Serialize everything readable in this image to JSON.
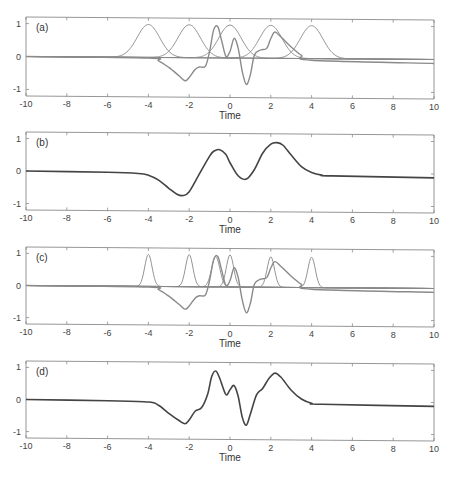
{
  "chart_data": [
    {
      "panel": "(a)",
      "type": "line",
      "title": "",
      "xlabel": "Time",
      "ylabel": "",
      "xlim": [
        -10,
        10
      ],
      "ylim": [
        -1.2,
        1.2
      ],
      "xticks": [
        -10,
        -8,
        -6,
        -4,
        -2,
        0,
        2,
        4,
        6,
        8,
        10
      ],
      "yticks": [
        -1,
        0,
        1
      ],
      "grid": false,
      "legend": null,
      "series": [
        {
          "name": "gaussian basis centered -4",
          "kind": "basis",
          "center": -4,
          "width": 0.55,
          "amplitude": 1
        },
        {
          "name": "gaussian basis centered -2",
          "kind": "basis",
          "center": -2,
          "width": 0.55,
          "amplitude": 1
        },
        {
          "name": "gaussian basis centered 0",
          "kind": "basis",
          "center": 0,
          "width": 0.55,
          "amplitude": 1
        },
        {
          "name": "gaussian basis centered 2",
          "kind": "basis",
          "center": 2,
          "width": 0.55,
          "amplitude": 1
        },
        {
          "name": "gaussian basis centered 4",
          "kind": "basis",
          "center": 4,
          "width": 0.55,
          "amplitude": 1
        },
        {
          "name": "target signal",
          "kind": "signal",
          "x": [
            -10,
            -4,
            -3.5,
            -3,
            -2.5,
            -2.2,
            -2,
            -1.7,
            -1.5,
            -1.2,
            -1,
            -0.8,
            -0.6,
            -0.4,
            -0.2,
            0,
            0.2,
            0.4,
            0.6,
            0.8,
            1.0,
            1.2,
            1.5,
            1.8,
            2.0,
            2.2,
            2.5,
            3.0,
            3.5,
            4.0,
            10
          ],
          "y": [
            0,
            -0.02,
            -0.1,
            -0.3,
            -0.55,
            -0.7,
            -0.6,
            -0.35,
            -0.28,
            -0.25,
            0.2,
            0.85,
            0.95,
            0.5,
            0.05,
            0.2,
            0.6,
            0.3,
            -0.4,
            -0.8,
            -0.5,
            0.1,
            0.25,
            0.3,
            0.6,
            0.8,
            0.65,
            0.35,
            0.1,
            -0.05,
            -0.12
          ]
        }
      ]
    },
    {
      "panel": "(b)",
      "type": "line",
      "title": "",
      "xlabel": "Time",
      "ylabel": "",
      "xlim": [
        -10,
        10
      ],
      "ylim": [
        -1.2,
        1.2
      ],
      "xticks": [
        -10,
        -8,
        -6,
        -4,
        -2,
        0,
        2,
        4,
        6,
        8,
        10
      ],
      "yticks": [
        -1,
        0,
        1
      ],
      "grid": false,
      "legend": null,
      "series": [
        {
          "name": "reconstruction (5 bases)",
          "kind": "fit",
          "x": [
            -10,
            -6,
            -4.5,
            -4,
            -3.5,
            -3,
            -2.6,
            -2.3,
            -2,
            -1.5,
            -1,
            -0.8,
            -0.5,
            -0.2,
            0,
            0.4,
            0.8,
            1.2,
            1.6,
            2.0,
            2.3,
            2.6,
            3.0,
            3.5,
            4.0,
            4.5,
            5,
            10
          ],
          "y": [
            0,
            -0.02,
            -0.05,
            -0.1,
            -0.25,
            -0.5,
            -0.68,
            -0.72,
            -0.6,
            -0.05,
            0.5,
            0.65,
            0.7,
            0.55,
            0.3,
            -0.1,
            -0.2,
            0.1,
            0.6,
            0.88,
            0.93,
            0.85,
            0.55,
            0.2,
            0.02,
            -0.06,
            -0.08,
            -0.12
          ]
        }
      ]
    },
    {
      "panel": "(c)",
      "type": "line",
      "title": "",
      "xlabel": "Time",
      "ylabel": "",
      "xlim": [
        -10,
        10
      ],
      "ylim": [
        -1.2,
        1.2
      ],
      "xticks": [
        -10,
        -8,
        -6,
        -4,
        -2,
        0,
        2,
        4,
        6,
        8,
        10
      ],
      "yticks": [
        -1,
        0,
        1
      ],
      "grid": false,
      "legend": null,
      "series": [
        {
          "name": "narrow basis centered -4",
          "kind": "basis",
          "center": -4,
          "width": 0.18,
          "amplitude": 1
        },
        {
          "name": "narrow basis centered -2",
          "kind": "basis",
          "center": -2,
          "width": 0.18,
          "amplitude": 1
        },
        {
          "name": "narrow basis centered -0.7",
          "kind": "basis",
          "center": -0.7,
          "width": 0.2,
          "amplitude": 0.95
        },
        {
          "name": "narrow basis centered 0",
          "kind": "basis",
          "center": 0,
          "width": 0.18,
          "amplitude": 1
        },
        {
          "name": "narrow basis centered 2",
          "kind": "basis",
          "center": 2,
          "width": 0.18,
          "amplitude": 0.95
        },
        {
          "name": "narrow basis centered 4",
          "kind": "basis",
          "center": 4,
          "width": 0.18,
          "amplitude": 0.95
        },
        {
          "name": "target signal",
          "kind": "signal",
          "x": [
            -10,
            -4,
            -3.5,
            -3,
            -2.5,
            -2.2,
            -2,
            -1.7,
            -1.5,
            -1.2,
            -1,
            -0.8,
            -0.6,
            -0.4,
            -0.2,
            0,
            0.2,
            0.4,
            0.6,
            0.8,
            1.0,
            1.2,
            1.5,
            1.8,
            2.0,
            2.2,
            2.5,
            3.0,
            3.5,
            4.0,
            10
          ],
          "y": [
            0,
            -0.02,
            -0.1,
            -0.3,
            -0.55,
            -0.7,
            -0.6,
            -0.35,
            -0.28,
            -0.25,
            0.2,
            0.85,
            0.95,
            0.5,
            0.05,
            0.2,
            0.6,
            0.3,
            -0.4,
            -0.8,
            -0.5,
            0.1,
            0.25,
            0.3,
            0.6,
            0.8,
            0.65,
            0.35,
            0.1,
            -0.05,
            -0.12
          ]
        }
      ]
    },
    {
      "panel": "(d)",
      "type": "line",
      "title": "",
      "xlabel": "Time",
      "ylabel": "",
      "xlim": [
        -10,
        10
      ],
      "ylim": [
        -1.2,
        1.2
      ],
      "xticks": [
        -10,
        -8,
        -6,
        -4,
        -2,
        0,
        2,
        4,
        6,
        8,
        10
      ],
      "yticks": [
        -1,
        0,
        1
      ],
      "grid": false,
      "legend": null,
      "series": [
        {
          "name": "reconstruction (narrow bases)",
          "kind": "fit",
          "x": [
            -10,
            -6,
            -4,
            -3.5,
            -3,
            -2.5,
            -2.2,
            -2,
            -1.7,
            -1.4,
            -1.1,
            -0.9,
            -0.7,
            -0.5,
            -0.2,
            0,
            0.2,
            0.4,
            0.6,
            0.8,
            1.0,
            1.3,
            1.6,
            1.9,
            2.2,
            2.5,
            3.0,
            3.5,
            4.0,
            4.5,
            10
          ],
          "y": [
            0,
            -0.02,
            -0.05,
            -0.15,
            -0.4,
            -0.62,
            -0.72,
            -0.6,
            -0.32,
            -0.22,
            0.2,
            0.75,
            0.93,
            0.7,
            0.2,
            0.35,
            0.48,
            0.15,
            -0.5,
            -0.75,
            -0.4,
            0.2,
            0.4,
            0.7,
            0.88,
            0.75,
            0.35,
            0.08,
            -0.05,
            -0.08,
            -0.12
          ]
        }
      ]
    }
  ],
  "figure": {
    "panels": [
      {
        "label": "(a)",
        "xlabel": "Time"
      },
      {
        "label": "(b)",
        "xlabel": "Time"
      },
      {
        "label": "(c)",
        "xlabel": "Time"
      },
      {
        "label": "(d)",
        "xlabel": "Time"
      }
    ],
    "xtick_labels": [
      "-10",
      "-8",
      "-6",
      "-4",
      "-2",
      "0",
      "2",
      "4",
      "6",
      "8",
      "10"
    ],
    "ytick_labels": [
      "-1",
      "0",
      "1"
    ]
  }
}
